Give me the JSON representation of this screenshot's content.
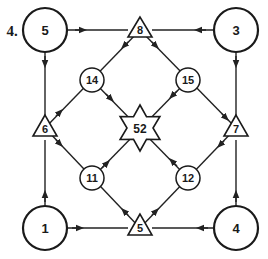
{
  "puzzle": {
    "number_label": "4.",
    "colors": {
      "stroke": "#1a1a1a",
      "fill": "#ffffff"
    }
  },
  "nodes": {
    "corner_top_left": {
      "shape": "large-circle",
      "value": "5"
    },
    "corner_top_right": {
      "shape": "large-circle",
      "value": "3"
    },
    "corner_bottom_left": {
      "shape": "large-circle",
      "value": "1"
    },
    "corner_bottom_right": {
      "shape": "large-circle",
      "value": "4"
    },
    "tri_top": {
      "shape": "triangle",
      "value": "8"
    },
    "tri_left": {
      "shape": "triangle",
      "value": "6"
    },
    "tri_right": {
      "shape": "triangle",
      "value": "7"
    },
    "tri_bottom": {
      "shape": "triangle",
      "value": "5"
    },
    "inner_top_left": {
      "shape": "small-circle",
      "value": "14"
    },
    "inner_top_right": {
      "shape": "small-circle",
      "value": "15"
    },
    "inner_bottom_left": {
      "shape": "small-circle",
      "value": "11"
    },
    "inner_bottom_right": {
      "shape": "small-circle",
      "value": "12"
    },
    "center": {
      "shape": "star",
      "value": "52"
    }
  },
  "edges": [
    {
      "from": "5 (top-left circle)",
      "to": "8 (top triangle)"
    },
    {
      "from": "3 (top-right circle)",
      "to": "8 (top triangle)"
    },
    {
      "from": "5 (top-left circle)",
      "to": "6 (left triangle)"
    },
    {
      "from": "1 (bottom-left circle)",
      "to": "6 (left triangle)"
    },
    {
      "from": "3 (top-right circle)",
      "to": "7 (right triangle)"
    },
    {
      "from": "4 (bottom-right circle)",
      "to": "7 (right triangle)"
    },
    {
      "from": "1 (bottom-left circle)",
      "to": "5 (bottom triangle)"
    },
    {
      "from": "4 (bottom-right circle)",
      "to": "5 (bottom triangle)"
    },
    {
      "from": "8",
      "to": "14"
    },
    {
      "from": "8",
      "to": "15"
    },
    {
      "from": "6",
      "to": "14"
    },
    {
      "from": "6",
      "to": "11"
    },
    {
      "from": "15",
      "to": "7"
    },
    {
      "from": "7",
      "to": "12"
    },
    {
      "from": "5 (bottom triangle)",
      "to": "11"
    },
    {
      "from": "5 (bottom triangle)",
      "to": "12"
    },
    {
      "from": "14",
      "to": "52"
    },
    {
      "from": "15",
      "to": "52"
    },
    {
      "from": "11",
      "to": "52"
    },
    {
      "from": "12",
      "to": "52"
    }
  ]
}
